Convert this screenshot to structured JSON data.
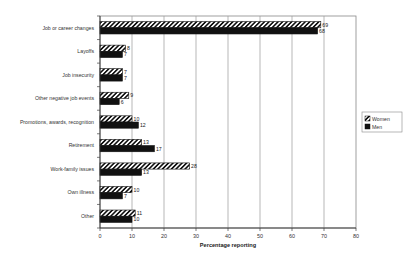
{
  "chart_data": {
    "type": "bar",
    "orientation": "horizontal",
    "title": "",
    "xlabel": "Percentage reporting",
    "ylabel": "",
    "xlim": [
      0,
      80
    ],
    "xticks": [
      0,
      10,
      20,
      30,
      40,
      50,
      60,
      70,
      80
    ],
    "grid": "vertical",
    "legend_position": "right",
    "categories": [
      "Job or career changes",
      "Layoffs",
      "Job insecurity",
      "Other negative job events",
      "Promotions, awards, recognition",
      "Retirement",
      "Work-family issues",
      "Own illness",
      "Other"
    ],
    "series": [
      {
        "name": "Women",
        "pattern": "diagonal-hatch",
        "values": [
          69,
          8,
          7,
          9,
          10,
          13,
          28,
          10,
          11
        ]
      },
      {
        "name": "Men",
        "pattern": "solid-black",
        "values": [
          68,
          7,
          7,
          6,
          12,
          17,
          13,
          7,
          10
        ]
      }
    ]
  }
}
